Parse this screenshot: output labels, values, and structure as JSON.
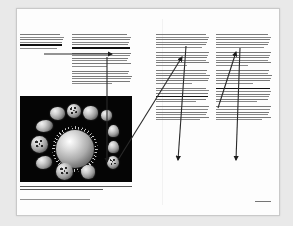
{
  "document": {
    "kind": "two-page printed spread",
    "page_background": "#fdfdfd",
    "surround_background": "#e9e9e9",
    "border_color": "#c9c9c9"
  },
  "left_page": {
    "columns": [
      {
        "id": "column-1",
        "lines": 6,
        "highlighted_line_index": 4,
        "text_color": "#5b5b5b"
      },
      {
        "id": "column-2",
        "lines": 18,
        "highlighted_line_index": 5,
        "text_color": "#5b5b5b"
      }
    ],
    "figure": {
      "name": "pollen-micrograph",
      "style": "scanning electron micrograph, false-grayscale on black field",
      "background": "#050505",
      "grain_count": 13,
      "center_grain": "large spiny spherical pollen grain",
      "surrounding_grains": "ring of smaller ovoid, reniform, triangular and porate grains"
    },
    "caption_lines": 2,
    "credit_lines": 1
  },
  "right_page": {
    "columns": [
      {
        "id": "column-3",
        "lines": 30,
        "highlighted_line_index": 21,
        "text_color": "#5b5b5b"
      },
      {
        "id": "column-4",
        "lines": 30,
        "highlighted_line_index": 18,
        "text_color": "#5b5b5b"
      }
    ],
    "folio_lines": 1
  },
  "annotations": {
    "line_color": "#2a2a2a",
    "items": [
      {
        "name": "annotation-arrow-horizontal",
        "from": [
          44,
          54
        ],
        "to": [
          112,
          54
        ],
        "style": "horizontal leader with solid arrowhead",
        "target": "highlighted phrase in column 2"
      },
      {
        "name": "annotation-line-vertical",
        "from": [
          107,
          57
        ],
        "to": [
          107,
          162
        ],
        "style": "vertical leader, no arrowhead",
        "target": "pollen micrograph"
      },
      {
        "name": "annotation-arrow-diagonal-long",
        "from": [
          118,
          160
        ],
        "to": [
          182,
          57
        ],
        "style": "long diagonal leader with arrowhead",
        "target": "highlighted phrase in column 3"
      },
      {
        "name": "annotation-arrow-column3-down",
        "from": [
          186,
          46
        ],
        "to": [
          178,
          160
        ],
        "style": "near-vertical leader with downward arrowhead",
        "target": "passage low in column 3"
      },
      {
        "name": "annotation-arrow-column4-diagonal",
        "from": [
          218,
          108
        ],
        "to": [
          236,
          52
        ],
        "style": "diagonal leader with upward arrowhead",
        "target": "highlighted phrase in column 4"
      },
      {
        "name": "annotation-arrow-column4-down",
        "from": [
          240,
          48
        ],
        "to": [
          236,
          160
        ],
        "style": "near-vertical leader with downward arrowhead",
        "target": "passage low in column 4"
      }
    ]
  }
}
